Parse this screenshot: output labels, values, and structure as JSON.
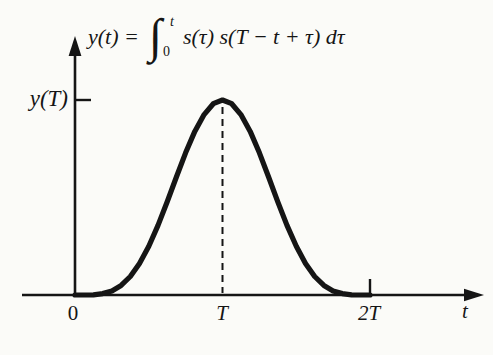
{
  "colors": {
    "ink": "#151515",
    "background": "#fbfbf8"
  },
  "formula": {
    "lhs": "y(t) =",
    "integral_sign": "∫",
    "upper_limit": "t",
    "lower_limit": "0",
    "integrand": "s(τ) s(T − t + τ) dτ"
  },
  "chart_data": {
    "type": "line",
    "xlabel": "t",
    "ylabel": "",
    "x_units": "multiples of T",
    "y_units": "normalized to peak value y(T)",
    "xlim": [
      0,
      2.75
    ],
    "ylim": [
      0,
      1.35
    ],
    "grid": false,
    "legend": false,
    "x_ticks": [
      {
        "pos": 0,
        "label": "0"
      },
      {
        "pos": 1,
        "label": "T"
      },
      {
        "pos": 2,
        "label": "2T"
      }
    ],
    "y_ticks": [
      {
        "pos": 1,
        "label": "y(T)"
      }
    ],
    "series": [
      {
        "name": "y(t)",
        "x": [
          0,
          0.0625,
          0.125,
          0.1875,
          0.25,
          0.3125,
          0.375,
          0.4375,
          0.5,
          0.5625,
          0.625,
          0.6875,
          0.75,
          0.8125,
          0.875,
          0.9375,
          1,
          1.0625,
          1.125,
          1.1875,
          1.25,
          1.3125,
          1.375,
          1.4375,
          1.5,
          1.5625,
          1.625,
          1.6875,
          1.75,
          1.8125,
          1.875,
          1.9375,
          2
        ],
        "y": [
          0,
          0.0001,
          0.001,
          0.007,
          0.021,
          0.049,
          0.095,
          0.162,
          0.25,
          0.357,
          0.478,
          0.605,
          0.729,
          0.839,
          0.925,
          0.981,
          1,
          0.981,
          0.925,
          0.839,
          0.729,
          0.605,
          0.478,
          0.357,
          0.25,
          0.162,
          0.095,
          0.049,
          0.021,
          0.007,
          0.001,
          0.0001,
          0
        ]
      }
    ],
    "annotations": [
      {
        "type": "dashed-vline",
        "x": 1,
        "y_from": 0,
        "y_to": 1
      },
      {
        "type": "axis-tick",
        "axis": "x",
        "pos": 2,
        "label": "2T"
      },
      {
        "type": "axis-tick",
        "axis": "y",
        "pos": 1,
        "label": "y(T)"
      }
    ]
  }
}
